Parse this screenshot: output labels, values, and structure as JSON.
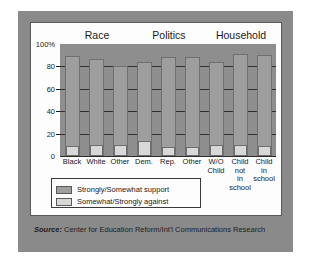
{
  "chart_data": {
    "type": "bar",
    "title": "",
    "subtitle": "",
    "xlabel": "",
    "ylabel": "",
    "ylim": [
      0,
      100
    ],
    "yticks": [
      "100%",
      "80",
      "60",
      "40",
      "20",
      "0"
    ],
    "ytick_values": [
      100,
      80,
      60,
      40,
      20,
      0
    ],
    "grid": true,
    "legend_position": "bottom-left",
    "group_headers": [
      "Race",
      "Politics",
      "Household"
    ],
    "groups": [
      {
        "label": "Race",
        "categories": [
          "Black",
          "White",
          "Other"
        ]
      },
      {
        "label": "Politics",
        "categories": [
          "Dem.",
          "Rep.",
          "Other"
        ]
      },
      {
        "label": "Household",
        "categories": [
          "W/O Child",
          "Child not in school",
          "Child in school"
        ]
      }
    ],
    "categories": [
      "Black",
      "White",
      "Other",
      "Dem.",
      "Rep.",
      "Other",
      "W/O Child",
      "Child not in school",
      "Child in school"
    ],
    "series": [
      {
        "name": "Strongly/Somewhat support",
        "color": "#9e9e9e",
        "values": [
          89,
          87,
          80,
          84,
          88,
          88,
          84,
          91,
          90
        ]
      },
      {
        "name": "Somewhat/Strongly against",
        "color": "#d8d8d8",
        "values": [
          9,
          10,
          10,
          13,
          8,
          8,
          10,
          10,
          9
        ]
      }
    ]
  },
  "legend": {
    "items": [
      {
        "label": "Strongly/Somewhat support",
        "color": "#9e9e9e"
      },
      {
        "label": "Somewhat/Strongly against",
        "color": "#d8d8d8"
      }
    ]
  },
  "source": {
    "lead": "Source:",
    "text": " Center for Education Reform/Int'l Communications Research"
  },
  "colors": {
    "frame": "#8a8a8a",
    "card": "#fdfdfd",
    "plot_background": "#8e8e8e",
    "gridline": "#2f2f2f",
    "support_bar": "#9e9e9e",
    "against_bar": "#d8d8d8",
    "text": "#1a1a1a"
  }
}
